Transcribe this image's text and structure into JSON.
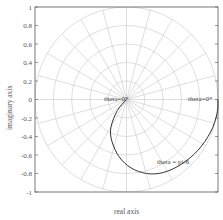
{
  "chart_data": {
    "type": "line",
    "subtype": "polar-grid-complex-plane",
    "title": "",
    "xlabel": "real axis",
    "ylabel": "imaginary axis",
    "xlim": [
      -1,
      1
    ],
    "ylim": [
      -1,
      1
    ],
    "yticks": [
      1,
      0.8,
      0.6,
      0.4,
      0.2,
      0,
      -0.2,
      -0.4,
      -0.6,
      -0.8,
      -1
    ],
    "ytick_labels": [
      "1",
      "0.8",
      "0.6",
      "0.4",
      "0.2",
      "0",
      "-0.2",
      "-0.4",
      "-0.6",
      "-0.8",
      "-1"
    ],
    "grid": "polar",
    "polar_grid": {
      "circle_radii": [
        0.2,
        0.4,
        0.6,
        0.8,
        1.0
      ],
      "spoke_step_deg": 15
    },
    "series": [
      {
        "name": "curve",
        "color": "#333333",
        "points": [
          [
            0,
            0
          ],
          [
            -0.1,
            -0.12
          ],
          [
            -0.17,
            -0.3
          ],
          [
            -0.16,
            -0.45
          ],
          [
            -0.08,
            -0.62
          ],
          [
            0.05,
            -0.74
          ],
          [
            0.22,
            -0.8
          ],
          [
            0.4,
            -0.79
          ],
          [
            0.6,
            -0.7
          ],
          [
            0.78,
            -0.55
          ],
          [
            0.92,
            -0.35
          ],
          [
            0.99,
            -0.15
          ],
          [
            1.0,
            0
          ]
        ]
      }
    ],
    "annotations": [
      {
        "text": "theta=0*",
        "x": 0,
        "y": 0
      },
      {
        "text": "theta=0*",
        "x": 1,
        "y": 0
      },
      {
        "text": "theta = pi/6",
        "x": 0.55,
        "y": -0.65
      }
    ]
  },
  "labels": {
    "xlabel": "real axis",
    "ylabel": "imaginary axis",
    "annot_center": "theta=0*",
    "annot_right": "theta=0*",
    "annot_bottom": "theta = pi/6"
  },
  "colors": {
    "grid": "#c8c8c8",
    "frame": "#555555",
    "curve": "#333333"
  }
}
